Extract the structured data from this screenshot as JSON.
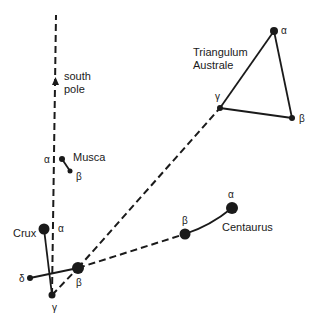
{
  "colors": {
    "ink": "#1a1a1a",
    "background": "#ffffff"
  },
  "labels": {
    "south_pole_line1": "south",
    "south_pole_line2": "pole",
    "musca": "Musca",
    "crux": "Crux",
    "centaurus": "Centaurus",
    "triangulum_line1": "Triangulum",
    "triangulum_line2": "Australe"
  },
  "constellations": {
    "crux": {
      "name": "Crux",
      "stars": [
        {
          "id": "alpha",
          "greek": "α",
          "x": 44,
          "y": 229,
          "r": 5.5
        },
        {
          "id": "beta",
          "greek": "β",
          "x": 78,
          "y": 268,
          "r": 6
        },
        {
          "id": "gamma",
          "greek": "γ",
          "x": 52,
          "y": 295,
          "r": 3.5
        },
        {
          "id": "delta",
          "greek": "δ",
          "x": 30,
          "y": 278,
          "r": 3
        }
      ]
    },
    "musca": {
      "name": "Musca",
      "stars": [
        {
          "id": "alpha",
          "greek": "α",
          "x": 62,
          "y": 159,
          "r": 3
        },
        {
          "id": "beta",
          "greek": "β",
          "x": 70,
          "y": 171,
          "r": 2.5
        }
      ]
    },
    "centaurus": {
      "name": "Centaurus",
      "stars": [
        {
          "id": "alpha",
          "greek": "α",
          "x": 232,
          "y": 208,
          "r": 6
        },
        {
          "id": "beta",
          "greek": "β",
          "x": 185,
          "y": 234,
          "r": 5.5
        }
      ]
    },
    "triangulum_australe": {
      "name": "Triangulum Australe",
      "stars": [
        {
          "id": "alpha",
          "greek": "α",
          "x": 274,
          "y": 31,
          "r": 4
        },
        {
          "id": "beta",
          "greek": "β",
          "x": 292,
          "y": 118,
          "r": 3
        },
        {
          "id": "gamma",
          "greek": "γ",
          "x": 220,
          "y": 108,
          "r": 3
        }
      ]
    }
  },
  "greek": {
    "alpha": "α",
    "beta": "β",
    "gamma": "γ",
    "delta": "δ"
  }
}
